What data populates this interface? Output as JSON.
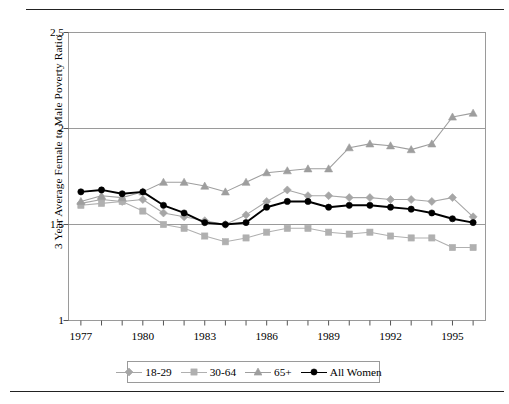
{
  "chart_data": {
    "type": "line",
    "title": "",
    "xlabel": "",
    "ylabel": "3 Year Average Female to Male Poverty Ratio",
    "xlim": [
      1976.4,
      1996.6
    ],
    "ylim": [
      1,
      2.5
    ],
    "yticks": [
      1,
      1.5,
      2,
      2.5
    ],
    "ytick_labels": [
      "1",
      "1.5",
      "2",
      "2.5"
    ],
    "xticks": [
      1977,
      1978,
      1979,
      1980,
      1981,
      1982,
      1983,
      1984,
      1985,
      1986,
      1987,
      1988,
      1989,
      1990,
      1991,
      1992,
      1993,
      1994,
      1995,
      1996
    ],
    "xtick_labels_shown": [
      "1977",
      "1980",
      "1983",
      "1986",
      "1989",
      "1992",
      "1995"
    ],
    "grid": "horizontal",
    "legend_position": "bottom",
    "x": [
      1977,
      1978,
      1979,
      1980,
      1981,
      1982,
      1983,
      1984,
      1985,
      1986,
      1987,
      1988,
      1989,
      1990,
      1991,
      1992,
      1993,
      1994,
      1995,
      1996
    ],
    "series": [
      {
        "name": "18-29",
        "marker": "diamond",
        "color": "#a6a6a6",
        "values": [
          1.61,
          1.63,
          1.62,
          1.63,
          1.56,
          1.54,
          1.52,
          1.5,
          1.55,
          1.62,
          1.68,
          1.65,
          1.65,
          1.64,
          1.64,
          1.63,
          1.63,
          1.62,
          1.64,
          1.54
        ]
      },
      {
        "name": "30-64",
        "marker": "square",
        "color": "#b0b0b0",
        "values": [
          1.6,
          1.61,
          1.62,
          1.57,
          1.5,
          1.48,
          1.44,
          1.41,
          1.43,
          1.46,
          1.48,
          1.48,
          1.46,
          1.45,
          1.46,
          1.44,
          1.43,
          1.43,
          1.38,
          1.38
        ]
      },
      {
        "name": "65+",
        "marker": "triangle",
        "color": "#9e9e9e",
        "values": [
          1.62,
          1.65,
          1.64,
          1.67,
          1.72,
          1.72,
          1.7,
          1.67,
          1.72,
          1.77,
          1.78,
          1.79,
          1.79,
          1.9,
          1.92,
          1.91,
          1.89,
          1.92,
          2.06,
          2.08
        ]
      },
      {
        "name": "All Women",
        "marker": "circle",
        "color": "#000000",
        "values": [
          1.67,
          1.68,
          1.66,
          1.67,
          1.6,
          1.56,
          1.51,
          1.5,
          1.51,
          1.59,
          1.62,
          1.62,
          1.59,
          1.6,
          1.6,
          1.59,
          1.58,
          1.56,
          1.53,
          1.51
        ]
      }
    ]
  },
  "legend": {
    "items": [
      {
        "label": "18-29"
      },
      {
        "label": "30-64"
      },
      {
        "label": "65+"
      },
      {
        "label": "All Women"
      }
    ]
  }
}
